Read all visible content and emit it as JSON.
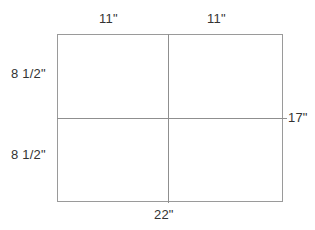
{
  "diagram": {
    "shape": {
      "name": "rectangle",
      "overall_width_label": "22\"",
      "overall_height_label": "17\"",
      "columns": 2,
      "rows": 2
    },
    "labels": {
      "top_left": "11\"",
      "top_right": "11\"",
      "left_top": "8 1/2\"",
      "left_bottom": "8 1/2\"",
      "bottom": "22\"",
      "right": "17\""
    },
    "colors": {
      "line": "#8f8f8f",
      "outline": "#9a9a9a",
      "text": "#333333",
      "background": "#ffffff"
    }
  }
}
